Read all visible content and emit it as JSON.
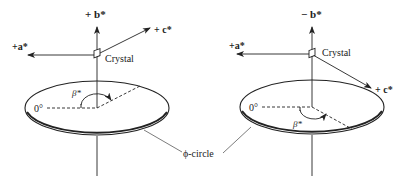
{
  "figure": {
    "left_panel": {
      "axis_top_label": "+ b*",
      "axis_a_label": "+a*",
      "axis_c_label": "+ c*",
      "crystal_label": "Crystal",
      "zero_label": "0°",
      "angle_label": "β*"
    },
    "right_panel": {
      "axis_top_label": "− b*",
      "axis_a_label": "+a*",
      "axis_c_label": "+ c*",
      "crystal_label": "Crystal",
      "zero_label": "0°",
      "angle_label": "β*"
    },
    "shared_label": "ϕ-circle",
    "colors": {
      "ink": "#222222",
      "background": "#ffffff"
    }
  }
}
